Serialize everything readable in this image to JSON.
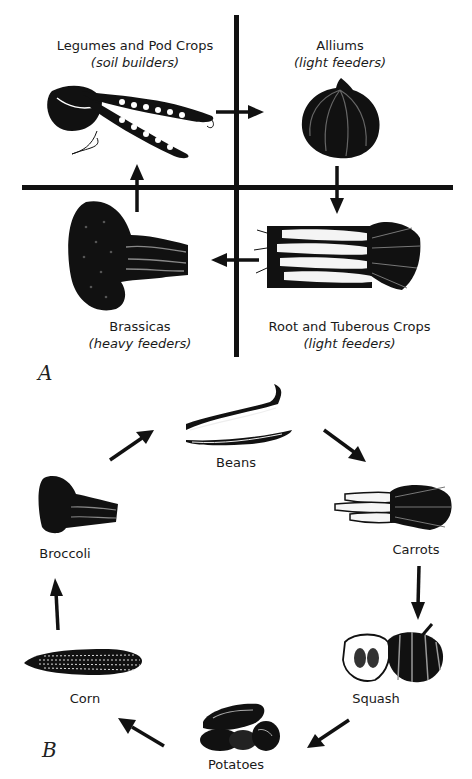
{
  "diagram": {
    "panel_a": {
      "letter": "A",
      "quadrants": [
        {
          "name": "Legumes and Pod Crops",
          "role": "(soil builders)",
          "icon": "pea-pods-icon",
          "position": "top-left"
        },
        {
          "name": "Alliums",
          "role": "(light feeders)",
          "icon": "onion-icon",
          "position": "top-right"
        },
        {
          "name": "Root and Tuberous Crops",
          "role": "(light feeders)",
          "icon": "carrots-icon",
          "position": "bottom-right"
        },
        {
          "name": "Brassicas",
          "role": "(heavy feeders)",
          "icon": "broccoli-icon",
          "position": "bottom-left"
        }
      ],
      "flow": [
        "Legumes and Pod Crops",
        "Alliums",
        "Root and Tuberous Crops",
        "Brassicas",
        "Legumes and Pod Crops"
      ]
    },
    "panel_b": {
      "letter": "B",
      "crops": [
        {
          "name": "Beans",
          "icon": "beans-icon"
        },
        {
          "name": "Carrots",
          "icon": "carrots-icon"
        },
        {
          "name": "Squash",
          "icon": "squash-icon"
        },
        {
          "name": "Potatoes",
          "icon": "potatoes-icon"
        },
        {
          "name": "Corn",
          "icon": "corn-icon"
        },
        {
          "name": "Broccoli",
          "icon": "broccoli-icon"
        }
      ],
      "flow": [
        "Beans",
        "Carrots",
        "Squash",
        "Potatoes",
        "Corn",
        "Broccoli",
        "Beans"
      ]
    }
  }
}
